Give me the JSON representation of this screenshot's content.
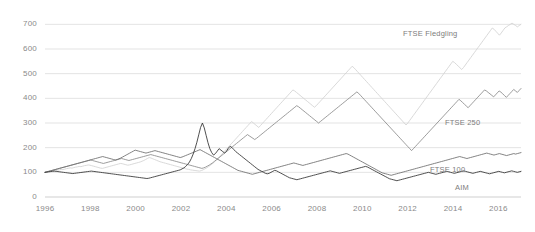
{
  "chart_data": {
    "type": "line",
    "title": "",
    "xlabel": "",
    "ylabel": "",
    "xlim": [
      1996,
      2017
    ],
    "ylim": [
      0,
      750
    ],
    "grid": true,
    "legend_position": "inline-right",
    "x_ticks": [
      "1996",
      "1998",
      "2000",
      "2002",
      "2004",
      "2006",
      "2008",
      "2010",
      "2012",
      "2014",
      "2016"
    ],
    "x_tick_values": [
      1996,
      1998,
      2000,
      2002,
      2004,
      2006,
      2008,
      2010,
      2012,
      2014,
      2016
    ],
    "y_ticks": [
      "0",
      "100",
      "200",
      "300",
      "400",
      "500",
      "600",
      "700"
    ],
    "y_tick_values": [
      0,
      100,
      200,
      300,
      400,
      500,
      600,
      700
    ],
    "x_start": 1996.0,
    "x_step": 0.0833,
    "series": [
      {
        "name": "FTSE Fledgling",
        "color": "#d2d2d2",
        "label_x": 403,
        "label_y": 29,
        "values": [
          100,
          101,
          103,
          104,
          106,
          105,
          107,
          109,
          110,
          112,
          111,
          113,
          115,
          116,
          118,
          117,
          119,
          121,
          122,
          124,
          123,
          125,
          127,
          128,
          130,
          129,
          127,
          125,
          123,
          121,
          119,
          117,
          116,
          118,
          120,
          122,
          124,
          126,
          128,
          130,
          132,
          134,
          136,
          135,
          133,
          131,
          129,
          130,
          132,
          134,
          136,
          138,
          140,
          142,
          145,
          148,
          152,
          156,
          160,
          158,
          155,
          152,
          149,
          146,
          143,
          141,
          139,
          137,
          135,
          133,
          131,
          129,
          127,
          125,
          123,
          121,
          119,
          117,
          115,
          113,
          112,
          110,
          109,
          108,
          107,
          106,
          105,
          107,
          110,
          114,
          118,
          123,
          128,
          134,
          140,
          147,
          154,
          162,
          170,
          178,
          186,
          194,
          202,
          210,
          218,
          226,
          234,
          242,
          250,
          258,
          266,
          274,
          282,
          290,
          298,
          306,
          300,
          294,
          288,
          282,
          290,
          298,
          306,
          314,
          322,
          330,
          338,
          346,
          354,
          362,
          370,
          378,
          386,
          394,
          402,
          410,
          418,
          426,
          434,
          430,
          424,
          418,
          412,
          406,
          400,
          394,
          388,
          382,
          376,
          370,
          364,
          370,
          378,
          386,
          394,
          402,
          410,
          418,
          426,
          434,
          442,
          450,
          458,
          466,
          474,
          482,
          490,
          498,
          506,
          514,
          522,
          530,
          524,
          516,
          508,
          500,
          492,
          484,
          476,
          468,
          460,
          452,
          444,
          436,
          428,
          420,
          412,
          404,
          396,
          388,
          380,
          372,
          364,
          356,
          348,
          340,
          332,
          324,
          316,
          308,
          300,
          292,
          300,
          310,
          320,
          330,
          340,
          350,
          360,
          370,
          380,
          390,
          400,
          410,
          420,
          430,
          440,
          450,
          460,
          470,
          480,
          490,
          500,
          510,
          520,
          530,
          540,
          550,
          545,
          538,
          531,
          524,
          517,
          525,
          535,
          545,
          555,
          565,
          575,
          585,
          595,
          605,
          615,
          625,
          635,
          645,
          655,
          665,
          675,
          685,
          680,
          672,
          664,
          656,
          665,
          675,
          685,
          690,
          695,
          700,
          705,
          700,
          695,
          690,
          695,
          700
        ]
      },
      {
        "name": "FTSE 250",
        "color": "#8a8a8a",
        "label_x": 445,
        "label_y": 118,
        "values": [
          100,
          102,
          104,
          106,
          108,
          110,
          112,
          114,
          116,
          118,
          120,
          122,
          124,
          126,
          128,
          130,
          132,
          134,
          136,
          138,
          140,
          142,
          144,
          146,
          148,
          150,
          148,
          146,
          144,
          142,
          140,
          138,
          136,
          138,
          140,
          142,
          144,
          146,
          148,
          150,
          152,
          154,
          156,
          154,
          152,
          150,
          148,
          150,
          152,
          154,
          156,
          158,
          160,
          162,
          164,
          166,
          168,
          170,
          172,
          170,
          168,
          166,
          164,
          162,
          160,
          158,
          156,
          154,
          152,
          150,
          148,
          146,
          144,
          142,
          140,
          138,
          136,
          134,
          132,
          130,
          128,
          126,
          124,
          122,
          120,
          118,
          116,
          118,
          121,
          125,
          129,
          134,
          139,
          145,
          151,
          157,
          163,
          169,
          175,
          181,
          187,
          193,
          199,
          205,
          211,
          217,
          223,
          229,
          235,
          241,
          247,
          253,
          248,
          243,
          238,
          233,
          238,
          244,
          250,
          256,
          262,
          268,
          274,
          280,
          286,
          292,
          298,
          304,
          310,
          316,
          322,
          328,
          334,
          340,
          346,
          352,
          358,
          364,
          370,
          366,
          360,
          354,
          348,
          342,
          336,
          330,
          324,
          318,
          312,
          306,
          300,
          306,
          312,
          318,
          324,
          330,
          336,
          342,
          348,
          354,
          360,
          366,
          372,
          378,
          384,
          390,
          396,
          402,
          408,
          414,
          420,
          426,
          420,
          412,
          404,
          396,
          388,
          380,
          372,
          364,
          356,
          348,
          340,
          332,
          324,
          316,
          308,
          300,
          292,
          284,
          276,
          268,
          260,
          252,
          244,
          236,
          228,
          220,
          212,
          204,
          196,
          188,
          196,
          204,
          212,
          220,
          228,
          236,
          244,
          252,
          260,
          268,
          276,
          284,
          292,
          300,
          308,
          316,
          324,
          332,
          340,
          348,
          356,
          364,
          372,
          380,
          388,
          396,
          390,
          383,
          376,
          369,
          362,
          370,
          378,
          386,
          394,
          402,
          410,
          418,
          426,
          434,
          430,
          424,
          418,
          412,
          406,
          414,
          422,
          430,
          425,
          418,
          411,
          404,
          412,
          420,
          428,
          436,
          430,
          424,
          432,
          440
        ]
      },
      {
        "name": "FTSE 100",
        "color": "#6d6d6d",
        "label_x": 430,
        "label_y": 165,
        "values": [
          100,
          102,
          104,
          106,
          108,
          110,
          112,
          114,
          116,
          118,
          120,
          122,
          124,
          126,
          128,
          130,
          132,
          134,
          136,
          138,
          140,
          142,
          144,
          146,
          148,
          150,
          152,
          154,
          156,
          158,
          160,
          162,
          164,
          162,
          160,
          158,
          156,
          154,
          152,
          150,
          152,
          155,
          158,
          162,
          166,
          170,
          174,
          178,
          182,
          186,
          190,
          188,
          186,
          184,
          182,
          180,
          178,
          180,
          182,
          184,
          186,
          188,
          186,
          184,
          182,
          180,
          178,
          176,
          174,
          172,
          170,
          168,
          166,
          164,
          162,
          160,
          162,
          165,
          168,
          171,
          174,
          177,
          180,
          183,
          186,
          189,
          192,
          188,
          184,
          180,
          176,
          172,
          168,
          164,
          160,
          156,
          152,
          148,
          144,
          140,
          136,
          132,
          128,
          124,
          120,
          116,
          112,
          108,
          106,
          104,
          102,
          100,
          98,
          96,
          94,
          92,
          94,
          96,
          98,
          100,
          102,
          104,
          106,
          108,
          110,
          112,
          114,
          116,
          118,
          120,
          122,
          124,
          126,
          128,
          130,
          132,
          134,
          136,
          138,
          136,
          134,
          132,
          130,
          128,
          130,
          132,
          134,
          136,
          138,
          140,
          142,
          144,
          146,
          148,
          150,
          152,
          154,
          156,
          158,
          160,
          162,
          164,
          166,
          168,
          170,
          172,
          174,
          176,
          174,
          170,
          166,
          162,
          158,
          154,
          150,
          146,
          142,
          138,
          134,
          130,
          126,
          122,
          118,
          114,
          110,
          106,
          102,
          98,
          96,
          94,
          92,
          90,
          88,
          90,
          92,
          94,
          96,
          98,
          100,
          102,
          104,
          106,
          108,
          110,
          112,
          114,
          116,
          118,
          120,
          122,
          124,
          126,
          128,
          130,
          132,
          134,
          136,
          138,
          140,
          142,
          144,
          146,
          148,
          150,
          152,
          154,
          156,
          158,
          160,
          162,
          164,
          162,
          160,
          158,
          156,
          158,
          160,
          162,
          164,
          166,
          168,
          170,
          172,
          174,
          176,
          178,
          176,
          174,
          172,
          170,
          172,
          174,
          176,
          174,
          172,
          170,
          168,
          170,
          172,
          174,
          176,
          174,
          176,
          178,
          180
        ]
      },
      {
        "name": "AIM",
        "color": "#303030",
        "label_x": 455,
        "label_y": 183,
        "values": [
          100,
          101,
          102,
          103,
          104,
          105,
          104,
          103,
          102,
          101,
          100,
          99,
          98,
          97,
          96,
          95,
          96,
          97,
          98,
          99,
          100,
          101,
          102,
          103,
          104,
          105,
          104,
          103,
          102,
          101,
          100,
          99,
          98,
          97,
          96,
          95,
          94,
          93,
          92,
          91,
          90,
          89,
          88,
          87,
          86,
          85,
          84,
          83,
          82,
          81,
          80,
          79,
          78,
          77,
          76,
          75,
          76,
          78,
          80,
          82,
          84,
          86,
          88,
          90,
          92,
          94,
          96,
          98,
          100,
          102,
          104,
          106,
          108,
          110,
          114,
          118,
          124,
          132,
          142,
          156,
          174,
          196,
          222,
          252,
          282,
          300,
          280,
          250,
          220,
          196,
          180,
          170,
          176,
          186,
          196,
          190,
          184,
          178,
          186,
          198,
          206,
          200,
          192,
          184,
          178,
          172,
          166,
          160,
          154,
          148,
          142,
          136,
          130,
          124,
          118,
          112,
          108,
          104,
          100,
          96,
          94,
          96,
          100,
          104,
          108,
          106,
          102,
          98,
          94,
          90,
          86,
          82,
          78,
          76,
          74,
          72,
          70,
          72,
          74,
          76,
          78,
          80,
          82,
          84,
          86,
          88,
          90,
          92,
          94,
          96,
          98,
          100,
          102,
          104,
          106,
          104,
          102,
          100,
          98,
          96,
          98,
          100,
          102,
          104,
          106,
          108,
          110,
          112,
          114,
          116,
          118,
          120,
          122,
          124,
          122,
          118,
          114,
          110,
          106,
          102,
          98,
          94,
          90,
          86,
          82,
          78,
          74,
          72,
          70,
          68,
          66,
          68,
          70,
          72,
          74,
          76,
          78,
          80,
          82,
          84,
          86,
          88,
          90,
          92,
          94,
          96,
          98,
          100,
          98,
          96,
          94,
          92,
          94,
          96,
          98,
          100,
          102,
          104,
          102,
          100,
          98,
          96,
          98,
          100,
          102,
          104,
          106,
          104,
          102,
          100,
          98,
          96,
          98,
          100,
          102,
          104,
          102,
          100,
          98,
          96,
          94,
          96,
          98,
          100,
          102,
          104,
          102,
          100,
          98,
          100,
          102,
          104,
          106,
          104,
          102,
          100,
          102,
          104
        ]
      }
    ]
  }
}
